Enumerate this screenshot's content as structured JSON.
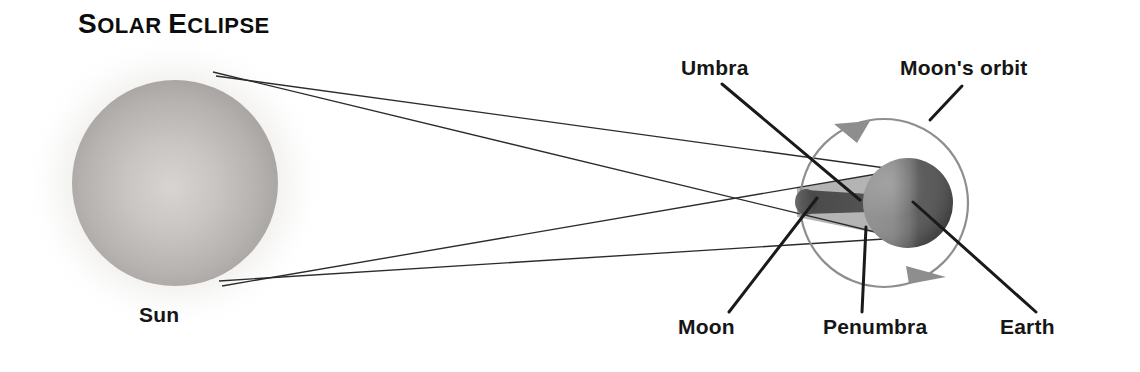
{
  "diagram": {
    "title_full": "SOLAR ECLIPSE",
    "title_word1_cap": "S",
    "title_word1_rest": "OLAR",
    "title_space": " ",
    "title_word2_cap": "E",
    "title_word2_rest": "CLIPSE",
    "labels": {
      "sun": "Sun",
      "umbra": "Umbra",
      "moons_orbit": "Moon's orbit",
      "moon": "Moon",
      "penumbra": "Penumbra",
      "earth": "Earth"
    },
    "colors": {
      "background": "#ffffff",
      "text": "#161616",
      "sun_body_light": "#d3d0cd",
      "sun_body_mid": "#b9b5b2",
      "sun_body_edge": "#a09c9a",
      "sun_halo": "#e8e6e4",
      "earth_light": "#8d8d8d",
      "earth_dark": "#4e4e4e",
      "moon_body": "#4a4a4a",
      "umbra": "#4f4f4f",
      "penumbra": "#a8a8a8",
      "orbit_line": "#8e8e8e",
      "orbit_arrow": "#8e8e8e",
      "ray_line": "#2b2b2b",
      "leader_line": "#1a1a1a"
    },
    "geometry": {
      "sun_center_x": 175,
      "sun_center_y": 183,
      "sun_radius": 103,
      "moon_x": 806,
      "moon_y": 202,
      "earth_center_x": 908,
      "earth_center_y": 203,
      "earth_radius": 45,
      "orbit_center_x": 884,
      "orbit_center_y": 203,
      "orbit_radius": 84
    }
  }
}
